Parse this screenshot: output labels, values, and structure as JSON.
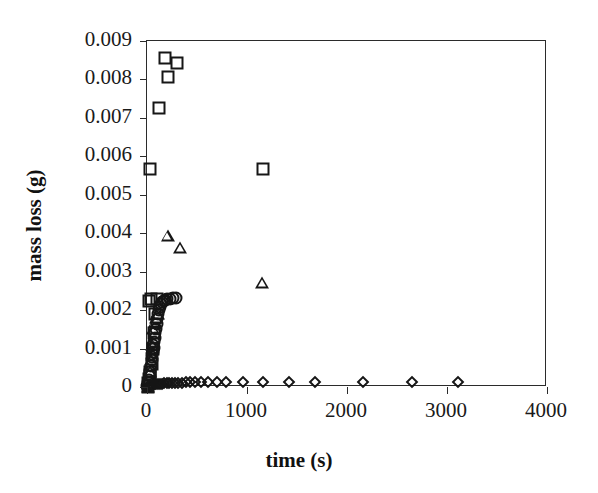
{
  "chart_data": {
    "type": "scatter",
    "title": "",
    "xlabel": "time (s)",
    "ylabel": "mass loss (g)",
    "xlim": [
      0,
      4000
    ],
    "ylim": [
      0,
      0.009
    ],
    "xticks": [
      0,
      1000,
      2000,
      3000,
      4000
    ],
    "xtick_labels": [
      "0",
      "1000",
      "2000",
      "3000",
      "4000"
    ],
    "yticks": [
      0,
      0.001,
      0.002,
      0.003,
      0.004,
      0.005,
      0.006,
      0.007,
      0.008,
      0.009
    ],
    "ytick_labels": [
      "0",
      "0.001",
      "0.002",
      "0.003",
      "0.004",
      "0.005",
      "0.006",
      "0.007",
      "0.008",
      "0.009"
    ],
    "grid": false,
    "legend": "none",
    "frame": "box",
    "series": [
      {
        "name": "squares",
        "marker": "open-square",
        "color": "#161616",
        "points": [
          [
            5,
            0.0
          ],
          [
            10,
            0.0001
          ],
          [
            18,
            0.0002
          ],
          [
            25,
            0.0003
          ],
          [
            34,
            0.0004
          ],
          [
            45,
            0.0006
          ],
          [
            58,
            0.001
          ],
          [
            70,
            0.0014
          ],
          [
            82,
            0.0019
          ],
          [
            95,
            0.0023
          ],
          [
            40,
            0.00228
          ],
          [
            20,
            0.00225
          ],
          [
            30,
            0.00568
          ],
          [
            122,
            0.00726
          ],
          [
            175,
            0.00857
          ],
          [
            205,
            0.00806
          ],
          [
            300,
            0.00842
          ],
          [
            1160,
            0.00568
          ]
        ]
      },
      {
        "name": "triangles",
        "marker": "open-triangle",
        "color": "#161616",
        "points": [
          [
            6,
            0.0
          ],
          [
            14,
            0.0001
          ],
          [
            22,
            0.0002
          ],
          [
            30,
            0.0004
          ],
          [
            40,
            0.0007
          ],
          [
            52,
            0.0011
          ],
          [
            64,
            0.0015
          ],
          [
            76,
            0.0017
          ],
          [
            88,
            0.0018
          ],
          [
            100,
            0.0019
          ],
          [
            112,
            0.0019
          ],
          [
            205,
            0.00394
          ],
          [
            330,
            0.00362
          ],
          [
            1150,
            0.0027
          ]
        ]
      },
      {
        "name": "circles",
        "marker": "open-circle",
        "color": "#161616",
        "points": [
          [
            4,
            2e-05
          ],
          [
            9,
            5e-05
          ],
          [
            15,
            0.0001
          ],
          [
            22,
            0.00018
          ],
          [
            28,
            0.00028
          ],
          [
            34,
            0.0004
          ],
          [
            40,
            0.00055
          ],
          [
            46,
            0.0007
          ],
          [
            52,
            0.00085
          ],
          [
            58,
            0.00098
          ],
          [
            64,
            0.00108
          ],
          [
            70,
            0.00118
          ],
          [
            76,
            0.00128
          ],
          [
            82,
            0.0014
          ],
          [
            88,
            0.00152
          ],
          [
            95,
            0.00165
          ],
          [
            102,
            0.00178
          ],
          [
            110,
            0.0019
          ],
          [
            118,
            0.002
          ],
          [
            128,
            0.00208
          ],
          [
            140,
            0.00215
          ],
          [
            152,
            0.0022
          ],
          [
            165,
            0.00224
          ],
          [
            180,
            0.00226
          ],
          [
            200,
            0.00228
          ],
          [
            225,
            0.0023
          ],
          [
            255,
            0.00231
          ],
          [
            290,
            0.00232
          ],
          [
            60,
            0.0009
          ],
          [
            66,
            0.00102
          ],
          [
            50,
            0.00078
          ]
        ]
      },
      {
        "name": "diamonds",
        "marker": "open-diamond",
        "color": "#161616",
        "points": [
          [
            5,
            2e-05
          ],
          [
            15,
            3e-05
          ],
          [
            28,
            4e-05
          ],
          [
            42,
            5e-05
          ],
          [
            58,
            6e-05
          ],
          [
            75,
            7e-05
          ],
          [
            92,
            8e-05
          ],
          [
            110,
            8e-05
          ],
          [
            130,
            9e-05
          ],
          [
            150,
            9e-05
          ],
          [
            172,
            0.0001
          ],
          [
            195,
            0.0001
          ],
          [
            220,
            0.0001
          ],
          [
            248,
            0.00011
          ],
          [
            278,
            0.00011
          ],
          [
            310,
            0.00011
          ],
          [
            345,
            0.00011
          ],
          [
            385,
            0.00012
          ],
          [
            430,
            0.00012
          ],
          [
            480,
            0.00012
          ],
          [
            540,
            0.00012
          ],
          [
            610,
            0.00012
          ],
          [
            700,
            0.00013
          ],
          [
            790,
            0.00013
          ],
          [
            960,
            0.00013
          ],
          [
            1160,
            0.00013
          ],
          [
            1420,
            0.00013
          ],
          [
            1680,
            0.00013
          ],
          [
            2160,
            0.00013
          ],
          [
            2650,
            0.00013
          ],
          [
            3110,
            0.00013
          ]
        ]
      }
    ]
  },
  "axis": {
    "x_title": "time (s)",
    "y_title": "mass loss (g)"
  }
}
